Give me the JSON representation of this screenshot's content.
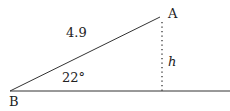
{
  "diagram": {
    "type": "right-triangle",
    "vertices": {
      "A": {
        "label": "A"
      },
      "B": {
        "label": "B"
      }
    },
    "hypotenuse_label": "4.9",
    "angle_label": "22°",
    "height_label": "h",
    "colors": {
      "stroke": "#333333",
      "text": "#222222",
      "background": "#ffffff"
    }
  }
}
